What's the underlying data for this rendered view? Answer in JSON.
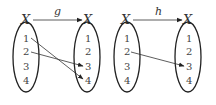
{
  "diagrams": [
    {
      "function_name": "g",
      "domain_label": "X",
      "codomain_label": "X",
      "domain_elements": [
        "1",
        "2",
        "3",
        "4"
      ],
      "codomain_elements": [
        "1",
        "2",
        "3",
        "4"
      ],
      "mappings_shown": [
        {
          "from": "1",
          "to": "4"
        },
        {
          "from": "2",
          "to": "3"
        }
      ]
    },
    {
      "function_name": "h",
      "domain_label": "X",
      "codomain_label": "X",
      "domain_elements": [
        "1",
        "2",
        "3",
        "4"
      ],
      "codomain_elements": [
        "1",
        "2",
        "3",
        "4"
      ],
      "mappings_shown": [
        {
          "from": "2",
          "to": "3"
        }
      ]
    }
  ],
  "colors": {
    "stroke": "#222222",
    "text": "#444444",
    "background": "#ffffff"
  }
}
